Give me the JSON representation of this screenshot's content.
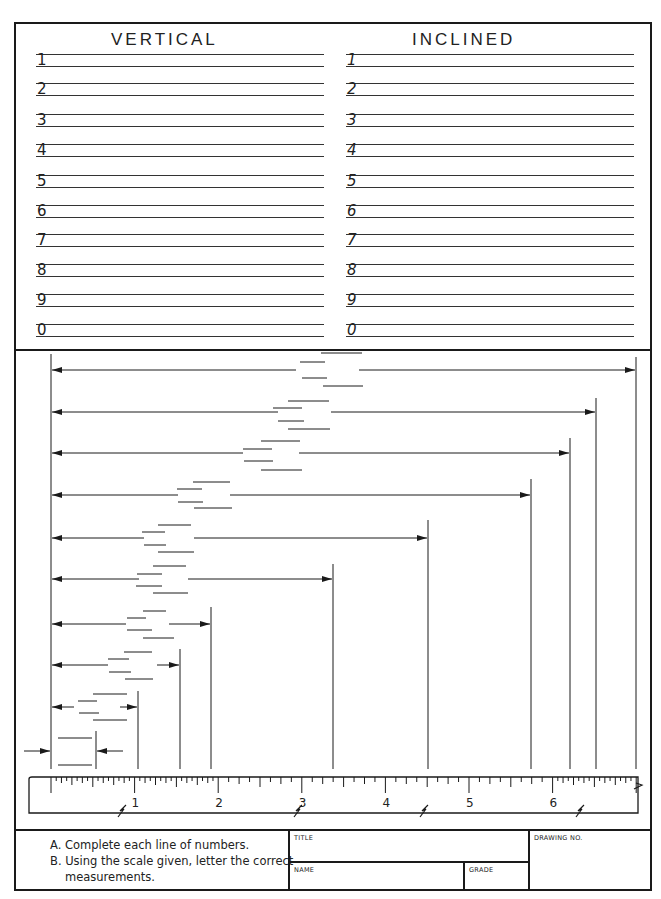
{
  "page": {
    "header_text": ""
  },
  "lettering": {
    "vertical": {
      "title": "VERTICAL",
      "rows": [
        "1",
        "2",
        "3",
        "4",
        "5",
        "6",
        "7",
        "8",
        "9",
        "0"
      ]
    },
    "inclined": {
      "title": "INCLINED",
      "rows": [
        "1",
        "2",
        "3",
        "4",
        "5",
        "6",
        "7",
        "8",
        "9",
        "0"
      ]
    }
  },
  "scale": {
    "labels": [
      "1",
      "2",
      "3",
      "4",
      "5",
      "6",
      "7"
    ],
    "units": "inches",
    "subdivisions_fine_ranges": [
      "0-2",
      "6-7"
    ],
    "subdivisions_coarse_range": "2-6"
  },
  "dimensions": {
    "count": 10,
    "approx_measurements_in": [
      7.0,
      6.5,
      6.2,
      5.75,
      4.5,
      3.37,
      1.9,
      1.55,
      1.05,
      0.54
    ]
  },
  "instructions": {
    "a_marker": "A.",
    "a_text": "Complete each line of numbers.",
    "b_marker": "B.",
    "b_text_line1": "Using the scale given, letter the correct",
    "b_text_line2": "measurements."
  },
  "title_block": {
    "title_label": "TITLE",
    "name_label": "NAME",
    "grade_label": "GRADE",
    "drawing_no_label": "DRAWING NO.",
    "title_value": "",
    "name_value": "",
    "grade_value": "",
    "drawing_no_value": ""
  }
}
